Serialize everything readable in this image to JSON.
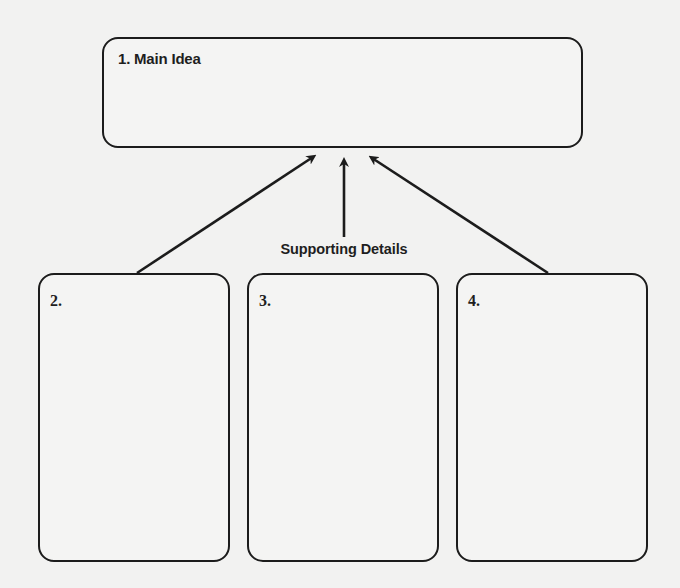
{
  "diagram": {
    "type": "graphic-organizer",
    "main_idea": {
      "label": "1. Main Idea"
    },
    "caption": "Supporting Details",
    "details": [
      {
        "label": "2."
      },
      {
        "label": "3."
      },
      {
        "label": "4."
      }
    ],
    "arrows": [
      {
        "from": "detail-2",
        "to": "main-idea"
      },
      {
        "from": "caption",
        "to": "main-idea"
      },
      {
        "from": "detail-4",
        "to": "main-idea"
      }
    ]
  },
  "colors": {
    "background": "#f2f2f1",
    "stroke": "#1c1c1c",
    "text": "#1e1e1e"
  }
}
